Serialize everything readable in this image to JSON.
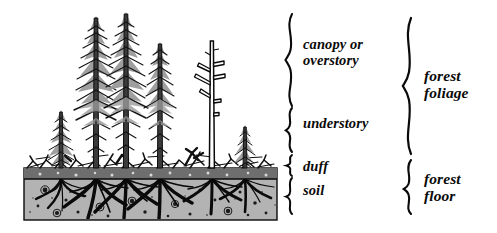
{
  "diagram": {
    "background_color": "#ffffff",
    "ink_color": "#0a0a0a",
    "soil_fill_color": "#b3b3b3",
    "duff_fill_color": "#6e6e6e",
    "foliage_gray_color": "#9a9a9a"
  },
  "layer_labels": [
    {
      "id": "canopy",
      "lines": [
        "canopy or",
        "overstory"
      ]
    },
    {
      "id": "understory",
      "lines": [
        "understory"
      ]
    },
    {
      "id": "duff",
      "lines": [
        "duff"
      ]
    },
    {
      "id": "soil",
      "lines": [
        "soil"
      ]
    }
  ],
  "group_labels": [
    {
      "id": "forest_foliage",
      "lines": [
        "forest",
        "foliage"
      ]
    },
    {
      "id": "forest_floor",
      "lines": [
        "forest",
        "floor"
      ]
    }
  ],
  "text": {
    "canopy_line1": "canopy or",
    "canopy_line2": "overstory",
    "understory": "understory",
    "duff": "duff",
    "soil": "soil",
    "foliage_line1": "forest",
    "foliage_line2": "foliage",
    "floor_line1": "forest",
    "floor_line2": "floor"
  },
  "scene": {
    "ground_surface_y": 168,
    "soil_block": {
      "x": 24,
      "y": 168,
      "width": 253,
      "height": 52
    },
    "duff_band": {
      "x": 24,
      "y": 168,
      "width": 253,
      "height": 11
    },
    "tall_trees": [
      {
        "trunk_x": 96,
        "top_y": 14,
        "type": "conifer-tall"
      },
      {
        "trunk_x": 126,
        "top_y": 10,
        "type": "conifer-tall"
      },
      {
        "trunk_x": 160,
        "top_y": 40,
        "type": "conifer-tall"
      },
      {
        "trunk_x": 212,
        "top_y": 40,
        "type": "snag-bare"
      }
    ],
    "understory_trees": [
      {
        "trunk_x": 61,
        "top_y": 108,
        "type": "conifer-small"
      },
      {
        "trunk_x": 245,
        "top_y": 123,
        "type": "conifer-small"
      }
    ]
  },
  "braces": {
    "canopy": {
      "x": 288,
      "y_top": 14,
      "y_bottom": 106
    },
    "understory": {
      "x": 288,
      "y_top": 108,
      "y_bottom": 152
    },
    "duff": {
      "x": 288,
      "y_top": 155,
      "y_bottom": 176
    },
    "soil": {
      "x": 288,
      "y_top": 178,
      "y_bottom": 214
    },
    "forest_foliage": {
      "x": 406,
      "y_top": 18,
      "y_bottom": 154
    },
    "forest_floor": {
      "x": 406,
      "y_top": 160,
      "y_bottom": 214
    }
  }
}
